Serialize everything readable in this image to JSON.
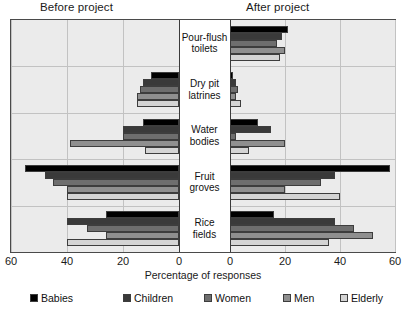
{
  "panels": {
    "before_label": "Before project",
    "after_label": "After project"
  },
  "axis": {
    "title": "Percentage of responses",
    "tick_labels_left": [
      "60",
      "40",
      "20",
      "0"
    ],
    "tick_labels_right": [
      "0",
      "20",
      "40",
      "60"
    ],
    "max": 60
  },
  "legend": {
    "items": [
      {
        "label": "Babies",
        "color": "#000000"
      },
      {
        "label": "Children",
        "color": "#3a3a3a"
      },
      {
        "label": "Women",
        "color": "#6e6e6e"
      },
      {
        "label": "Men",
        "color": "#8f8f8f"
      },
      {
        "label": "Elderly",
        "color": "#d4d4d4"
      }
    ]
  },
  "chart_data": {
    "type": "bar",
    "orientation": "horizontal",
    "layout": "diverging-pyramid",
    "title": "",
    "xlabel": "Percentage of responses",
    "ylabel": "",
    "xlim": [
      0,
      60
    ],
    "grid": true,
    "legend_position": "bottom",
    "categories": [
      "Pour-flush toilets",
      "Dry pit latrines",
      "Water bodies",
      "Fruit groves",
      "Rice fields"
    ],
    "panels": [
      "Before project",
      "After project"
    ],
    "series": [
      {
        "name": "Babies",
        "color": "#000000",
        "before": [
          0,
          10,
          13,
          55,
          26
        ],
        "after": [
          21,
          1,
          10,
          58,
          16
        ]
      },
      {
        "name": "Children",
        "color": "#3a3a3a",
        "before": [
          0,
          13,
          20,
          48,
          40
        ],
        "after": [
          19,
          2,
          15,
          38,
          38
        ]
      },
      {
        "name": "Women",
        "color": "#6e6e6e",
        "before": [
          0,
          14,
          20,
          45,
          33
        ],
        "after": [
          17,
          3,
          2,
          33,
          45
        ]
      },
      {
        "name": "Men",
        "color": "#8f8f8f",
        "before": [
          0,
          15,
          39,
          40,
          26
        ],
        "after": [
          20,
          2,
          20,
          20,
          52
        ]
      },
      {
        "name": "Elderly",
        "color": "#d4d4d4",
        "before": [
          0,
          15,
          12,
          40,
          40
        ],
        "after": [
          18,
          4,
          7,
          40,
          36
        ]
      }
    ]
  }
}
